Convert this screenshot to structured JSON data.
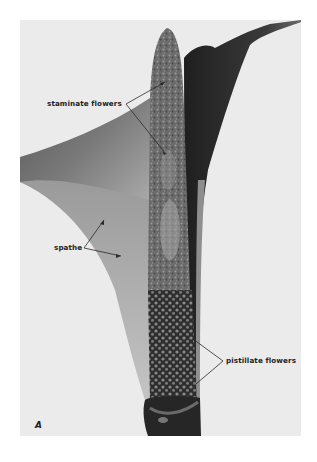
{
  "figure": {
    "panel_letter": "A",
    "labels": {
      "staminate": "staminate flowers",
      "spathe": "spathe",
      "pistillate": "pistillate flowers"
    },
    "colors": {
      "page_background": "#ffffff",
      "photo_background": "#ebebeb",
      "dark_tissue": "#2b2b2b",
      "mid_tissue": "#6e6e6e",
      "light_tissue": "#b9b9b9",
      "label_text": "#1f1f1f"
    }
  }
}
